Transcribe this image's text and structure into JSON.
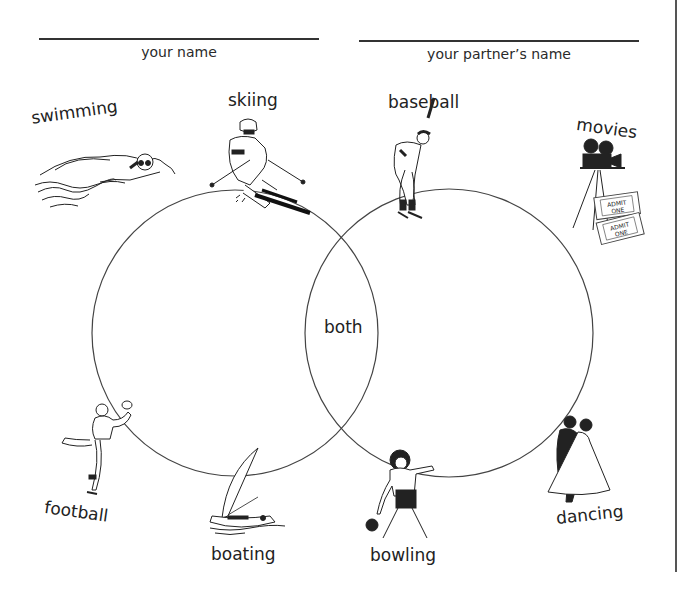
{
  "header": {
    "left_caption": "your name",
    "right_caption": "your partner’s name"
  },
  "venn": {
    "intersection_label": "both",
    "left_circle": {
      "cx": 235,
      "cy": 333,
      "r": 143
    },
    "right_circle": {
      "cx": 449,
      "cy": 333,
      "r": 144
    },
    "stroke_color": "#444444"
  },
  "activities": [
    {
      "id": "swimming",
      "label": "swimming",
      "icon": "swimmer-icon"
    },
    {
      "id": "skiing",
      "label": "skiing",
      "icon": "skier-icon"
    },
    {
      "id": "baseball",
      "label": "baseball",
      "icon": "batter-icon"
    },
    {
      "id": "movies",
      "label": "movies",
      "icon": "movie-camera-icon"
    },
    {
      "id": "football",
      "label": "football",
      "icon": "football-player-icon"
    },
    {
      "id": "boating",
      "label": "boating",
      "icon": "sailboat-icon"
    },
    {
      "id": "bowling",
      "label": "bowling",
      "icon": "bowler-icon"
    },
    {
      "id": "dancing",
      "label": "dancing",
      "icon": "dancing-couple-icon"
    }
  ],
  "tickets": {
    "line1": "ADMIT",
    "line2": "ONE"
  }
}
